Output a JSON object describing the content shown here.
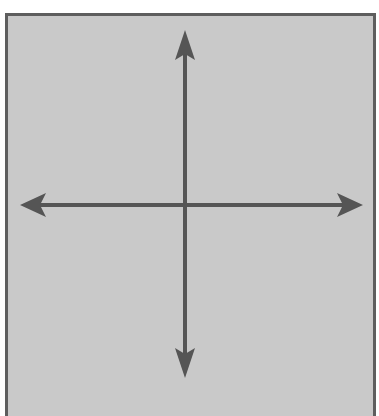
{
  "diagram": {
    "type": "coordinate-axes",
    "colors": {
      "background": "#c9c9c9",
      "border": "#5e5e5e",
      "arrow": "#555555"
    },
    "axes": {
      "horizontal": {
        "x1": 20,
        "x2": 363,
        "y": 205
      },
      "vertical": {
        "x": 185,
        "y1": 30,
        "y2": 378
      }
    }
  }
}
